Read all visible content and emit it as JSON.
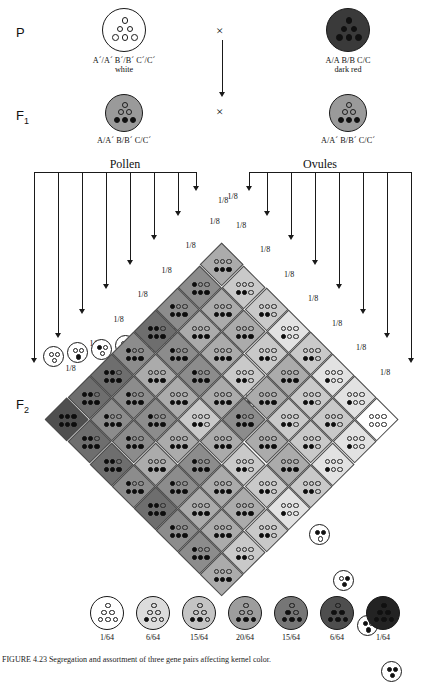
{
  "generations": {
    "p_label": "P",
    "f1_label": "F",
    "f1_sub": "1",
    "f2_label": "F",
    "f2_sub": "2"
  },
  "cross_symbol": "×",
  "parents": [
    {
      "genotype": "A´/A´ B´/B´ C´/C´",
      "phenotype": "white",
      "filled_dots": 0,
      "shade": "#ffffff"
    },
    {
      "genotype": "A/A B/B C/C",
      "phenotype": "dark red",
      "filled_dots": 6,
      "shade": "#3a3a3a"
    }
  ],
  "f1": [
    {
      "genotype": "A/A´ B/B´ C/C´",
      "filled_dots": 3,
      "shade": "#9a9a9a"
    },
    {
      "genotype": "A/A´ B/B´ C/C´",
      "filled_dots": 3,
      "shade": "#9a9a9a"
    }
  ],
  "gamete_headers": {
    "left": "Pollen",
    "right": "Ovules"
  },
  "gamete_fraction": "1/8",
  "gametes": {
    "pollen": [
      {
        "dots": [
          1,
          1,
          1
        ],
        "frac": "1/8"
      },
      {
        "dots": [
          1,
          0,
          1
        ],
        "frac": "1/8"
      },
      {
        "dots": [
          0,
          1,
          1
        ],
        "frac": "1/8"
      },
      {
        "dots": [
          1,
          1,
          0
        ],
        "frac": "1/8"
      },
      {
        "dots": [
          0,
          1,
          0
        ],
        "frac": "1/8"
      },
      {
        "dots": [
          1,
          0,
          0
        ],
        "frac": "1/8"
      },
      {
        "dots": [
          0,
          0,
          1
        ],
        "frac": "1/8"
      },
      {
        "dots": [
          0,
          0,
          0
        ],
        "frac": "1/8"
      }
    ],
    "ovules": [
      {
        "dots": [
          0,
          0,
          0
        ],
        "frac": "1/8"
      },
      {
        "dots": [
          0,
          0,
          1
        ],
        "frac": "1/8"
      },
      {
        "dots": [
          1,
          0,
          0
        ],
        "frac": "1/8"
      },
      {
        "dots": [
          0,
          1,
          0
        ],
        "frac": "1/8"
      },
      {
        "dots": [
          1,
          1,
          0
        ],
        "frac": "1/8"
      },
      {
        "dots": [
          0,
          1,
          1
        ],
        "frac": "1/8"
      },
      {
        "dots": [
          1,
          0,
          1
        ],
        "frac": "1/8"
      },
      {
        "dots": [
          1,
          1,
          1
        ],
        "frac": "1/8"
      }
    ]
  },
  "punnett": {
    "rows": 8,
    "cols": 8,
    "row_gametes": [
      0,
      1,
      1,
      2,
      1,
      2,
      2,
      3
    ],
    "col_gametes": [
      3,
      2,
      2,
      1,
      2,
      1,
      1,
      0
    ],
    "shades": [
      "#ffffff",
      "#e2e2e2",
      "#c9c9c9",
      "#ababab",
      "#8c8c8c",
      "#6e6e6e",
      "#4f4f4f",
      "#2e2e2e"
    ]
  },
  "legend": [
    {
      "filled": 0,
      "frac": "1/64",
      "shade": "#ffffff"
    },
    {
      "filled": 1,
      "frac": "6/64",
      "shade": "#dcdcdc"
    },
    {
      "filled": 2,
      "frac": "15/64",
      "shade": "#c4c4c4"
    },
    {
      "filled": 3,
      "frac": "20/64",
      "shade": "#9d9d9d"
    },
    {
      "filled": 4,
      "frac": "15/64",
      "shade": "#767676"
    },
    {
      "filled": 5,
      "frac": "6/64",
      "shade": "#4e4e4e"
    },
    {
      "filled": 6,
      "frac": "1/64",
      "shade": "#232323"
    }
  ],
  "caption": "FIGURE 4.23  Segregation and assortment of three gene pairs affecting kernel color."
}
